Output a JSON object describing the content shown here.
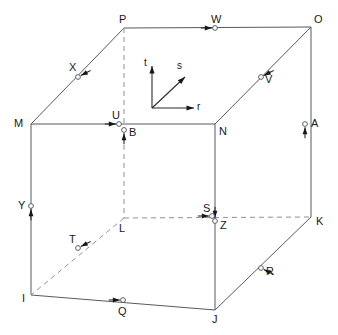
{
  "figure": {
    "kind": "3d-cube-stress-element-diagram",
    "background_color": "#ffffff",
    "edge_color_solid": "#555a5e",
    "edge_color_hidden": "#8d9297",
    "marker_color": "#ffffff",
    "arrow_color": "#15181a"
  },
  "axes": {
    "origin": {
      "x": 152,
      "y": 108
    },
    "labels": {
      "t": "t",
      "s": "s",
      "r": "r"
    },
    "t_label_pos": {
      "x": 144,
      "y": 58
    },
    "s_label_pos": {
      "x": 177,
      "y": 61
    },
    "r_label_pos": {
      "x": 197,
      "y": 102
    }
  },
  "vertices": [
    {
      "name": "P",
      "label": "P",
      "x": 124,
      "y": 28,
      "label_x": 119,
      "label_y": 14
    },
    {
      "name": "O",
      "label": "O",
      "x": 311,
      "y": 27,
      "label_x": 314,
      "label_y": 14
    },
    {
      "name": "M",
      "label": "M",
      "x": 31,
      "y": 124,
      "label_x": 14,
      "label_y": 118
    },
    {
      "name": "N",
      "label": "N",
      "x": 215,
      "y": 124,
      "label_x": 219,
      "label_y": 126
    },
    {
      "name": "L",
      "label": "L",
      "x": 124,
      "y": 218,
      "label_x": 119,
      "label_y": 223
    },
    {
      "name": "K",
      "label": "K",
      "x": 311,
      "y": 217,
      "label_x": 316,
      "label_y": 216
    },
    {
      "name": "I",
      "label": "I",
      "x": 31,
      "y": 295,
      "label_x": 22,
      "label_y": 293
    },
    {
      "name": "J",
      "label": "J",
      "x": 215,
      "y": 310,
      "label_x": 212,
      "label_y": 314
    }
  ],
  "edges": [
    {
      "name": "P-O",
      "from": "P",
      "to": "O",
      "hidden": false
    },
    {
      "name": "P-M",
      "from": "P",
      "to": "M",
      "hidden": false
    },
    {
      "name": "O-N",
      "from": "O",
      "to": "N",
      "hidden": false
    },
    {
      "name": "O-K",
      "from": "O",
      "to": "K",
      "hidden": false
    },
    {
      "name": "M-N",
      "from": "M",
      "to": "N",
      "hidden": false
    },
    {
      "name": "M-I",
      "from": "M",
      "to": "I",
      "hidden": false
    },
    {
      "name": "N-J",
      "from": "N",
      "to": "J",
      "hidden": false
    },
    {
      "name": "K-J",
      "from": "K",
      "to": "J",
      "hidden": false
    },
    {
      "name": "I-J",
      "from": "I",
      "to": "J",
      "hidden": false
    },
    {
      "name": "P-L",
      "from": "P",
      "to": "L",
      "hidden": true
    },
    {
      "name": "L-K",
      "from": "L",
      "to": "K",
      "hidden": true
    },
    {
      "name": "L-I",
      "from": "L",
      "to": "I",
      "hidden": true
    }
  ],
  "markers": [
    {
      "name": "W",
      "label": "W",
      "cx": 215,
      "cy": 28,
      "label_x": 211,
      "label_y": 14,
      "arrow": "right"
    },
    {
      "name": "X",
      "label": "X",
      "cx": 78,
      "cy": 77,
      "label_x": 69,
      "label_y": 62,
      "arrow": "down-left"
    },
    {
      "name": "V",
      "label": "V",
      "cx": 261,
      "cy": 77,
      "label_x": 265,
      "label_y": 74,
      "arrow": "down-left"
    },
    {
      "name": "U",
      "label": "U",
      "cx": 119,
      "cy": 124,
      "label_x": 112,
      "label_y": 110,
      "arrow": "right"
    },
    {
      "name": "B",
      "label": "B",
      "cx": 124,
      "cy": 130,
      "label_x": 129,
      "label_y": 127,
      "arrow": "up"
    },
    {
      "name": "A",
      "label": "A",
      "cx": 305,
      "cy": 124,
      "label_x": 311,
      "label_y": 118,
      "arrow": "up"
    },
    {
      "name": "Y",
      "label": "Y",
      "cx": 31,
      "cy": 206,
      "label_x": 18,
      "label_y": 200,
      "arrow": "up"
    },
    {
      "name": "S",
      "label": "S",
      "cx": 212,
      "cy": 216,
      "label_x": 203,
      "label_y": 203,
      "arrow": "right"
    },
    {
      "name": "Z",
      "label": "Z",
      "cx": 215,
      "cy": 221,
      "label_x": 220,
      "label_y": 220,
      "arrow": "down"
    },
    {
      "name": "T",
      "label": "T",
      "cx": 78,
      "cy": 248,
      "label_x": 69,
      "label_y": 234,
      "arrow": "down-left"
    },
    {
      "name": "R",
      "label": "R",
      "cx": 261,
      "cy": 268,
      "label_x": 266,
      "label_y": 266,
      "arrow": "up-left"
    },
    {
      "name": "Q",
      "label": "Q",
      "cx": 123,
      "cy": 300,
      "label_x": 118,
      "label_y": 306,
      "arrow": "right"
    }
  ]
}
